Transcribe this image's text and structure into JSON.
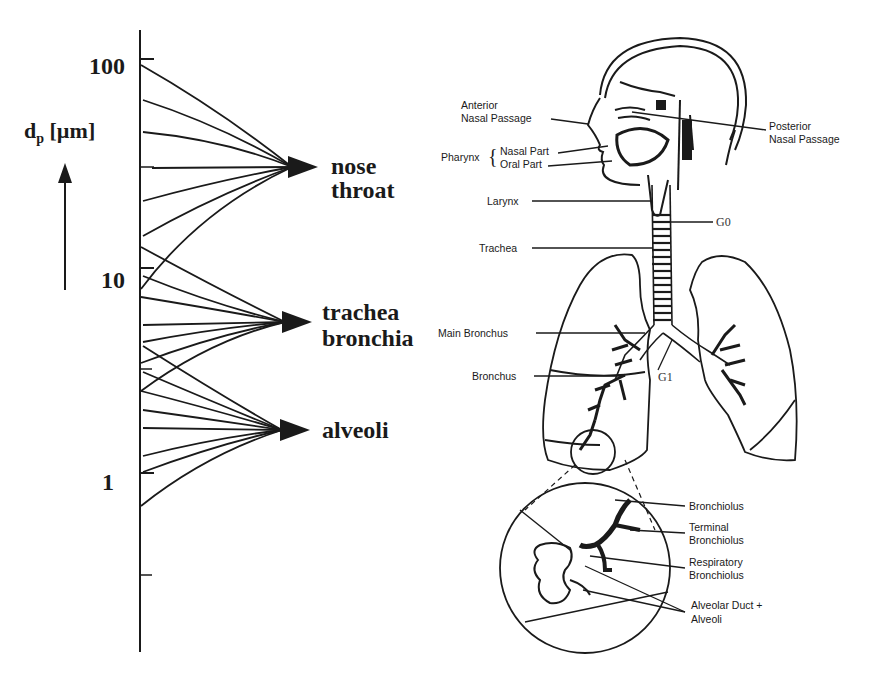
{
  "axis": {
    "title": "d",
    "title_sub": "p",
    "title_unit": " [µm]",
    "scale": "log",
    "ticks": [
      "100",
      "10",
      "1"
    ],
    "direction_icon": "up-arrow-icon"
  },
  "regions": [
    {
      "line1": "nose",
      "line2": "throat",
      "size_range_um": "~8 to 100"
    },
    {
      "line1": "trachea",
      "line2": "bronchia",
      "size_range_um": "~2.5 to 13"
    },
    {
      "line1": "alveoli",
      "line2": "",
      "size_range_um": "~0.7 to 4"
    }
  ],
  "anatomy": {
    "labels": {
      "anterior_1": "Anterior",
      "anterior_2": "Nasal Passage",
      "posterior_1": "Posterior",
      "posterior_2": "Nasal Passage",
      "pharynx": "Pharynx",
      "nasal_part": "Nasal Part",
      "oral_part": "Oral Part",
      "larynx": "Larynx",
      "trachea": "Trachea",
      "main_bronchus": "Main Bronchus",
      "bronchus": "Bronchus",
      "g0": "G0",
      "g1": "G1",
      "bronchiolus": "Bronchiolus",
      "terminal_1": "Terminal",
      "terminal_2": "Bronchiolus",
      "respiratory_1": "Respiratory",
      "respiratory_2": "Bronchiolus",
      "alveolar_1": "Alveolar Duct +",
      "alveolar_2": "Alveoli"
    }
  },
  "colors": {
    "ink": "#1a1a1a",
    "background": "#ffffff"
  }
}
